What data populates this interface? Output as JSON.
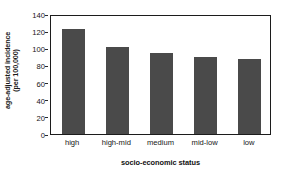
{
  "chart_data": {
    "type": "bar",
    "title": "",
    "subtitle": "",
    "categories": [
      "high",
      "high-mid",
      "medium",
      "mid-low",
      "low"
    ],
    "values": [
      122,
      101,
      94,
      90,
      87
    ],
    "series": [
      {
        "name": "age-adjusted incidence (per 100,000)",
        "values": [
          122,
          101,
          94,
          90,
          87
        ]
      }
    ],
    "xlabel": "socio-economic status",
    "ylabel": "age-adjusted incidence",
    "ylabel_line2": "(per 100,000)",
    "ylim": [
      0,
      140
    ],
    "yticks": [
      0,
      20,
      40,
      60,
      80,
      100,
      120,
      140
    ],
    "ytick_labels": [
      "0",
      "20",
      "40",
      "60",
      "80",
      "100",
      "120",
      "140"
    ],
    "grid": false,
    "legend": false,
    "legend_position": "none",
    "bar_color": "#4a4a4a",
    "frame_color": "#1c1c1c",
    "background_color": "#ffffff"
  }
}
